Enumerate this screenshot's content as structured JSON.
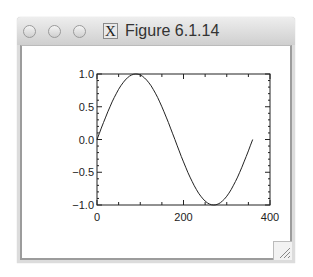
{
  "window": {
    "title": "Figure 6.1.14",
    "app_icon": "x11-icon",
    "app_icon_glyph": "X",
    "controls": [
      "close-button",
      "minimize-button",
      "zoom-button"
    ]
  },
  "chart_data": {
    "type": "line",
    "title": "",
    "xlabel": "",
    "ylabel": "",
    "xlim": [
      0,
      400
    ],
    "ylim": [
      -1.0,
      1.0
    ],
    "grid": false,
    "legend": null,
    "x_ticks": [
      "0",
      "200",
      "400"
    ],
    "y_ticks": [
      "1.0",
      "0.5",
      "0.0",
      "−0.5",
      "−1.0"
    ],
    "series": [
      {
        "name": "sin(x degrees)",
        "x": [
          0,
          30,
          60,
          90,
          120,
          150,
          180,
          210,
          240,
          270,
          300,
          330,
          360
        ],
        "values": [
          0.0,
          0.5,
          0.866,
          1.0,
          0.866,
          0.5,
          0.0,
          -0.5,
          -0.866,
          -1.0,
          -0.866,
          -0.5,
          0.0
        ]
      }
    ]
  }
}
